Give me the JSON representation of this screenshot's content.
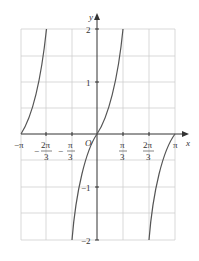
{
  "graph": {
    "function": "y = tan(x)",
    "x_axis_label": "x",
    "y_axis_label": "y",
    "origin_label": "O",
    "x_ticks": [
      {
        "label": "−π"
      },
      {
        "num": "2π",
        "den": "3",
        "sign": "−"
      },
      {
        "num": "π",
        "den": "3",
        "sign": "−"
      },
      {
        "num": "π",
        "den": "3",
        "sign": ""
      },
      {
        "num": "2π",
        "den": "3",
        "sign": ""
      },
      {
        "label": "π"
      }
    ],
    "y_ticks": [
      "2",
      "1",
      "−1",
      "−2"
    ],
    "xlim": [
      "−π",
      "π"
    ],
    "ylim": [
      -2,
      2
    ],
    "colors": {
      "grid": "#c8c8c8",
      "axis": "#333333",
      "curve": "#555555"
    }
  }
}
